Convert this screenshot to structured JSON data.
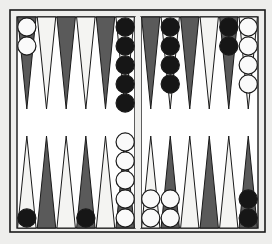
{
  "game": "backgammon",
  "colors": {
    "background": "#eeeeec",
    "frame": "#1a1a1a",
    "dark_point": "#5a5a5a",
    "light_point": "#f4f4f2",
    "black_checker": "#161616",
    "white_checker": "#fafafa"
  },
  "board": {
    "frame": {
      "x": 10,
      "y": 10,
      "w": 255,
      "h": 222
    },
    "inner": {
      "x": 17,
      "y": 17,
      "w": 241,
      "h": 211
    },
    "bar": {
      "x": 135,
      "w": 6
    },
    "point_width": 19.6,
    "point_height": 92,
    "checker_d": 19
  },
  "points": {
    "top_left": [
      {
        "shade": "dark",
        "checkers": {
          "color": "white",
          "count": 2
        }
      },
      {
        "shade": "light",
        "checkers": {
          "color": null,
          "count": 0
        }
      },
      {
        "shade": "dark",
        "checkers": {
          "color": null,
          "count": 0
        }
      },
      {
        "shade": "light",
        "checkers": {
          "color": null,
          "count": 0
        }
      },
      {
        "shade": "dark",
        "checkers": {
          "color": null,
          "count": 0
        }
      },
      {
        "shade": "light",
        "checkers": {
          "color": "black",
          "count": 5
        }
      }
    ],
    "top_right": [
      {
        "shade": "dark",
        "checkers": {
          "color": null,
          "count": 0
        }
      },
      {
        "shade": "light",
        "checkers": {
          "color": "black",
          "count": 4
        }
      },
      {
        "shade": "dark",
        "checkers": {
          "color": null,
          "count": 0
        }
      },
      {
        "shade": "light",
        "checkers": {
          "color": null,
          "count": 0
        }
      },
      {
        "shade": "dark",
        "checkers": {
          "color": "black",
          "count": 2
        }
      },
      {
        "shade": "light",
        "checkers": {
          "color": "white",
          "count": 4
        }
      }
    ],
    "bottom_left": [
      {
        "shade": "light",
        "checkers": {
          "color": "black",
          "count": 1
        }
      },
      {
        "shade": "dark",
        "checkers": {
          "color": null,
          "count": 0
        }
      },
      {
        "shade": "light",
        "checkers": {
          "color": null,
          "count": 0
        }
      },
      {
        "shade": "dark",
        "checkers": {
          "color": "black",
          "count": 1
        }
      },
      {
        "shade": "light",
        "checkers": {
          "color": null,
          "count": 0
        }
      },
      {
        "shade": "dark",
        "checkers": {
          "color": "white",
          "count": 5
        }
      }
    ],
    "bottom_right": [
      {
        "shade": "light",
        "checkers": {
          "color": "white",
          "count": 2
        }
      },
      {
        "shade": "dark",
        "checkers": {
          "color": "white",
          "count": 2
        }
      },
      {
        "shade": "light",
        "checkers": {
          "color": null,
          "count": 0
        }
      },
      {
        "shade": "dark",
        "checkers": {
          "color": null,
          "count": 0
        }
      },
      {
        "shade": "light",
        "checkers": {
          "color": null,
          "count": 0
        }
      },
      {
        "shade": "dark",
        "checkers": {
          "color": "black",
          "count": 2
        }
      }
    ]
  }
}
